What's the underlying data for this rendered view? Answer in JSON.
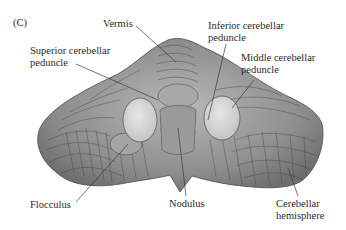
{
  "figure": {
    "panel_label": "(C)",
    "labels": {
      "vermis": "Vermis",
      "superior_peduncle_1": "Superior cerebellar",
      "superior_peduncle_2": "peduncle",
      "inferior_peduncle_1": "Inferior cerebellar",
      "inferior_peduncle_2": "peduncle",
      "middle_peduncle_1": "Middle cerebellar",
      "middle_peduncle_2": "peduncle",
      "flocculus": "Flocculus",
      "nodulus": "Nodulus",
      "hemisphere_1": "Cerebellar",
      "hemisphere_2": "hemisphere"
    },
    "colors": {
      "tissue": "#8f8f8f",
      "tissue_light": "#b5b5b5",
      "folia_lines": "#3c3c3c",
      "peduncle_cut": "#d9d9d9",
      "text": "#2a2a2a",
      "leader": "#3a3a3a"
    }
  }
}
